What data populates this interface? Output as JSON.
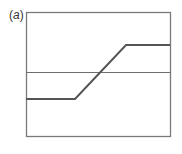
{
  "panel": {
    "label_open": "(",
    "label_letter": "a",
    "label_close": ")"
  },
  "colors": {
    "frame": "#7a7a7a",
    "reference_line": "#6e6e6e",
    "curve": "#555555",
    "background": "#ffffff"
  },
  "chart_data": {
    "type": "line",
    "title": "(a)",
    "xlabel": "",
    "ylabel": "",
    "grid": false,
    "frame_px": {
      "x0": 26,
      "y0": 12,
      "x1": 170,
      "y1": 136
    },
    "reference_line": {
      "y_px": 72,
      "description": "horizontal threshold line"
    },
    "series": [
      {
        "name": "ramp-step response",
        "points_px": [
          [
            26,
            99
          ],
          [
            75,
            99
          ],
          [
            126,
            45
          ],
          [
            170,
            45
          ]
        ]
      }
    ]
  }
}
